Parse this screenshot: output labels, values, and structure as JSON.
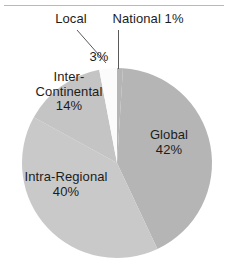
{
  "chart_data": {
    "type": "pie",
    "title": "",
    "subtitle": "",
    "xlabel": "",
    "ylabel": "",
    "legend_position": "none",
    "grid": false,
    "units": "percent",
    "total": 100,
    "categories": [
      "National",
      "Global",
      "Intra-Regional",
      "Inter-Continental",
      "Local"
    ],
    "values": [
      1,
      42,
      40,
      14,
      3
    ],
    "slices": [
      {
        "name": "National",
        "value": 1,
        "label": "National 1%",
        "value_label": "1%",
        "color": "#b5b5b5",
        "label_placement": "outside",
        "leader_line": "vertical"
      },
      {
        "name": "Global",
        "value": 42,
        "label": "Global",
        "value_label": "42%",
        "color": "#b5b5b5",
        "label_placement": "inside",
        "leader_line": "none"
      },
      {
        "name": "Intra-Regional",
        "value": 40,
        "label": "Intra-Regional",
        "value_label": "40%",
        "color": "#c9c9c9",
        "label_placement": "inside",
        "leader_line": "none"
      },
      {
        "name": "Inter-Continental",
        "value": 14,
        "label": "Inter-Continental",
        "value_label": "14%",
        "color": "#c4c4c4",
        "label_placement": "inside",
        "leader_line": "none"
      },
      {
        "name": "Local",
        "value": 3,
        "label": "Local",
        "value_label": "3%",
        "color": "#fbfbfb",
        "label_placement": "outside",
        "leader_line": "diagonal"
      }
    ]
  },
  "labels": {
    "local": "Local",
    "national": "National 1%",
    "local_value": "3%",
    "inter_continental_line1": "Inter-",
    "inter_continental_line2": "Continental",
    "inter_continental_value": "14%",
    "global": "Global",
    "global_value": "42%",
    "intra_regional": "Intra-Regional",
    "intra_regional_value": "40%"
  },
  "colors": {
    "global": "#b5b5b5",
    "intra_regional": "#c9c9c9",
    "inter_continental": "#c4c4c4",
    "local": "#fbfbfb",
    "national": "#b5b5b5",
    "text": "#1c1c1c",
    "leader_line": "#5a5a5a",
    "rule": "#b9b9b9",
    "background": "#ffffff"
  }
}
